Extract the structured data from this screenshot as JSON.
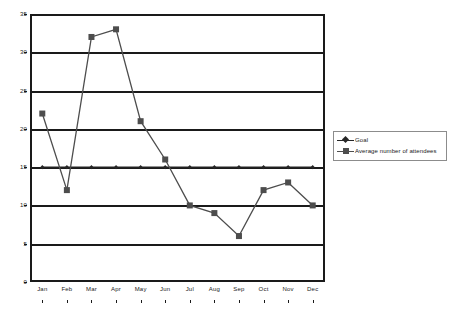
{
  "chart_data": {
    "type": "line",
    "title": "",
    "subtitle": "",
    "xlabel": "",
    "ylabel": "",
    "categories": [
      "Jan",
      "Feb",
      "Mar",
      "Apr",
      "May",
      "Jun",
      "Jul",
      "Aug",
      "Sep",
      "Oct",
      "Nov",
      "Dec"
    ],
    "series": [
      {
        "name": "Goal",
        "marker": "diamond",
        "color": "#262626",
        "values": [
          15,
          15,
          15,
          15,
          15,
          15,
          15,
          15,
          15,
          15,
          15,
          15
        ]
      },
      {
        "name": "Average number of attendees",
        "marker": "square",
        "color": "#4d4d4d",
        "values": [
          22,
          12,
          32,
          33,
          21,
          16,
          10,
          9,
          6,
          12,
          13,
          10
        ]
      }
    ],
    "ylim": [
      0,
      35
    ],
    "yticks": [
      0,
      5,
      10,
      15,
      20,
      25,
      30,
      35
    ],
    "ytick_labels": [
      "0",
      "5",
      "10",
      "15",
      "20",
      "25",
      "30",
      "35"
    ],
    "grid": true,
    "grid_axis": "y",
    "legend_position": "right",
    "plot_border": true,
    "colors": {
      "axis": "#1a1a1a",
      "gridline": "#1a1a1a",
      "goal_series": "#262626",
      "attendees_series": "#4d4d4d",
      "legend_border": "#8c8c8c",
      "background": "#ffffff"
    }
  },
  "legend": {
    "entries": [
      {
        "label": "Goal"
      },
      {
        "label": "Average number of attendees"
      }
    ]
  }
}
